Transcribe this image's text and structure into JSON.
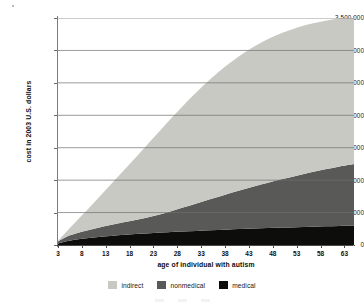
{
  "chart_data": {
    "type": "area",
    "title": "",
    "subtitle": "",
    "xlabel": "age of individual with autism",
    "ylabel": "cost in 2003 U.S. dollars",
    "stacked": true,
    "grid": true,
    "grid_axis": "y",
    "legend_position": "bottom",
    "xlim": [
      3,
      65
    ],
    "ylim": [
      0,
      3500000
    ],
    "x_tick_labels": [
      "3",
      "8",
      "13",
      "18",
      "23",
      "28",
      "33",
      "38",
      "43",
      "48",
      "53",
      "58",
      "63"
    ],
    "x_ticks": [
      3,
      8,
      13,
      18,
      23,
      28,
      33,
      38,
      43,
      48,
      53,
      58,
      63
    ],
    "y_tick_labels": [
      "0",
      "500,000",
      "1,000,000",
      "1,500,000",
      "2,000,000",
      "2,500,000",
      "3,000,000",
      "3,500,000"
    ],
    "y_ticks": [
      0,
      500000,
      1000000,
      1500000,
      2000000,
      2500000,
      3000000,
      3500000
    ],
    "x": [
      3,
      5,
      8,
      11,
      14,
      17,
      20,
      23,
      26,
      29,
      32,
      35,
      38,
      41,
      44,
      47,
      50,
      53,
      56,
      59,
      62,
      65
    ],
    "series": [
      {
        "name": "medical",
        "color": "#0d0d0b",
        "values": [
          20000,
          60000,
          95000,
          120000,
          140000,
          158000,
          172000,
          185000,
          196000,
          207000,
          217000,
          227000,
          236000,
          245000,
          253000,
          261000,
          268000,
          275000,
          282000,
          288000,
          294000,
          300000
        ]
      },
      {
        "name": "nonmedical",
        "color": "#595957",
        "values": [
          35000,
          75000,
          110000,
          140000,
          168000,
          196000,
          226000,
          262000,
          310000,
          366000,
          424000,
          482000,
          540000,
          596000,
          650000,
          700000,
          748000,
          794000,
          838000,
          880000,
          918000,
          950000
        ]
      },
      {
        "name": "indirect",
        "color": "#c9c9c4",
        "values": [
          10000,
          90000,
          250000,
          430000,
          620000,
          815000,
          1010000,
          1205000,
          1390000,
          1560000,
          1715000,
          1855000,
          1975000,
          2075000,
          2155000,
          2215000,
          2255000,
          2280000,
          2290000,
          2290000,
          2285000,
          2275000
        ]
      }
    ],
    "cumulative_totals": [
      65000,
      225000,
      455000,
      690000,
      928000,
      1169000,
      1408000,
      1652000,
      1896000,
      2133000,
      2356000,
      2564000,
      2751000,
      2916000,
      3058000,
      3176000,
      3271000,
      3349000,
      3410000,
      3458000,
      3497000,
      3525000
    ],
    "legend_entries": [
      {
        "label": "indirect",
        "color": "#c9c9c4"
      },
      {
        "label": "nonmedical",
        "color": "#595957"
      },
      {
        "label": "medical",
        "color": "#0d0d0b"
      }
    ]
  },
  "axes": {
    "y_labels": [
      "3,500,000",
      "3,000,000",
      "2,500,000",
      "2,000,000",
      "1,500,000",
      "1,000,000",
      "500,000",
      "0"
    ],
    "x_labels": [
      "3",
      "8",
      "13",
      "18",
      "23",
      "28",
      "33",
      "38",
      "43",
      "48",
      "53",
      "58",
      "63"
    ],
    "x_title": "age of individual with autism",
    "y_title": "cost in 2003 U.S. dollars"
  },
  "legend": {
    "items": [
      {
        "label": "indirect",
        "color": "#c9c9c4"
      },
      {
        "label": "nonmedical",
        "color": "#595957"
      },
      {
        "label": "medical",
        "color": "#0d0d0b"
      }
    ]
  },
  "colors": {
    "indirect": "#c9c9c4",
    "nonmedical": "#595957",
    "medical": "#0d0d0b",
    "gridline": "#6f6f6f",
    "background": "#ffffff"
  }
}
